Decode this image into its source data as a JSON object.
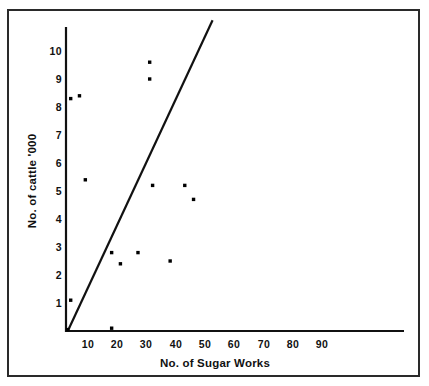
{
  "figure": {
    "axis_color": "#111111",
    "frame_color": "#2a2a2a",
    "point_color": "#000000",
    "background": "#ffffff"
  },
  "chart_data": {
    "type": "scatter",
    "title": "",
    "xlabel": "No. of Sugar Works",
    "ylabel": "No. of cattle '000",
    "xlim": [
      0,
      103
    ],
    "ylim": [
      0,
      10.7
    ],
    "grid": false,
    "legend": null,
    "xticks": [
      10,
      20,
      30,
      40,
      50,
      60,
      70,
      80,
      90
    ],
    "xtick_labels": [
      "10",
      "20",
      "30",
      "40",
      "50",
      "60",
      "70",
      "80",
      "90"
    ],
    "yticks": [
      1,
      2,
      3,
      4,
      5,
      6,
      7,
      8,
      9,
      10
    ],
    "ytick_labels": [
      "1",
      "2",
      "3",
      "4",
      "5",
      "6",
      "7",
      "8",
      "9",
      "10"
    ],
    "points": [
      {
        "x": 4,
        "y": 8.3
      },
      {
        "x": 7,
        "y": 8.4
      },
      {
        "x": 9,
        "y": 5.4
      },
      {
        "x": 4,
        "y": 1.1
      },
      {
        "x": 3,
        "y": 0.05
      },
      {
        "x": 18,
        "y": 0.1
      },
      {
        "x": 18,
        "y": 2.8
      },
      {
        "x": 21,
        "y": 2.4
      },
      {
        "x": 27,
        "y": 2.8
      },
      {
        "x": 31,
        "y": 9.6
      },
      {
        "x": 31,
        "y": 9.0
      },
      {
        "x": 32,
        "y": 5.2
      },
      {
        "x": 38,
        "y": 2.5
      },
      {
        "x": 43,
        "y": 5.2
      },
      {
        "x": 46,
        "y": 4.7
      }
    ],
    "trend_line": {
      "x_start": 3.0,
      "y_start": 0.0,
      "x_end": 52.5,
      "y_end": 11.1,
      "style": "solid",
      "color": "#111111"
    }
  },
  "axis_labels": {
    "x_title": "No. of Sugar Works",
    "y_title": "No. of cattle '000"
  },
  "icons": {
    "data_point": "dot-marker-icon",
    "trend": "trend-line-icon"
  }
}
